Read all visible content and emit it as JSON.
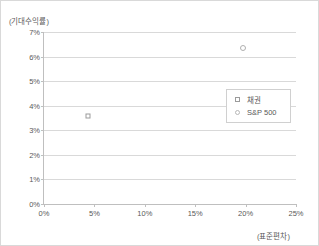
{
  "chart_data": {
    "type": "scatter",
    "title": "",
    "ylabel": "(기대수익률)",
    "xlabel": "(표준편차)",
    "xlim": [
      0,
      25
    ],
    "ylim": [
      0,
      7
    ],
    "grid": true,
    "legend_position": "inside-right",
    "x_ticks": [
      "0%",
      "5%",
      "10%",
      "15%",
      "20%",
      "25%"
    ],
    "x_tick_values": [
      0,
      5,
      10,
      15,
      20,
      25
    ],
    "y_ticks": [
      "0%",
      "1%",
      "2%",
      "3%",
      "4%",
      "5%",
      "6%",
      "7%"
    ],
    "y_tick_values": [
      0,
      1,
      2,
      3,
      4,
      5,
      6,
      7
    ],
    "series": [
      {
        "name": "채권",
        "marker": "square",
        "color": "#9b9b9b",
        "points": [
          {
            "x": 4.4,
            "y": 3.6
          }
        ]
      },
      {
        "name": "S&P 500",
        "marker": "circle",
        "color": "#b0b0b0",
        "points": [
          {
            "x": 19.7,
            "y": 6.35
          }
        ]
      }
    ]
  },
  "legend": {
    "items": [
      {
        "label": "채권",
        "marker": "square-marker-icon"
      },
      {
        "label": "S&P 500",
        "marker": "circle-marker-icon"
      }
    ]
  }
}
